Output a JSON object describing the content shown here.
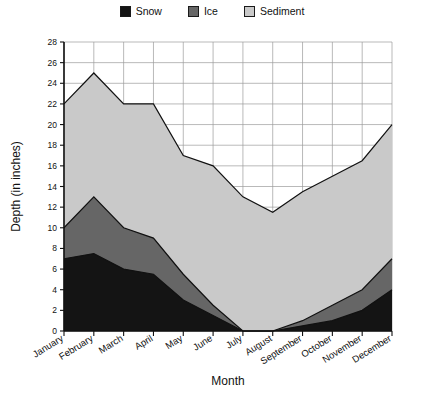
{
  "chart_data": {
    "type": "area",
    "stacked": true,
    "title": "",
    "xlabel": "Month",
    "ylabel": "Depth (in inches)",
    "ylim": [
      0,
      28
    ],
    "ytick_step": 2,
    "yticks": [
      0,
      2,
      4,
      6,
      8,
      10,
      12,
      14,
      16,
      18,
      20,
      22,
      24,
      26,
      28
    ],
    "grid": true,
    "legend_position": "top-center",
    "categories": [
      "January",
      "February",
      "March",
      "April",
      "May",
      "June",
      "July",
      "August",
      "September",
      "October",
      "November",
      "December"
    ],
    "series": [
      {
        "name": "Snow",
        "color": "#141414",
        "values": [
          7,
          7.5,
          6,
          5.5,
          3,
          1.5,
          0,
          0,
          0.5,
          1,
          2,
          4
        ]
      },
      {
        "name": "Ice",
        "color": "#666666",
        "values": [
          3,
          5.5,
          4,
          3.5,
          2.5,
          1,
          0,
          0,
          0.5,
          1.5,
          2,
          3
        ]
      },
      {
        "name": "Sediment",
        "color": "#c9c9c9",
        "values": [
          12,
          12,
          12,
          13,
          11.5,
          13.5,
          13,
          11.5,
          12.5,
          12.5,
          12.5,
          13
        ]
      }
    ],
    "cumulative_totals": [
      22,
      25,
      22,
      22,
      17,
      16,
      13,
      11.5,
      13.5,
      15,
      16.5,
      20
    ]
  },
  "legend": {
    "items": [
      {
        "label": "Snow",
        "color": "#141414",
        "icon": "legend-swatch-snow"
      },
      {
        "label": "Ice",
        "color": "#666666",
        "icon": "legend-swatch-ice"
      },
      {
        "label": "Sediment",
        "color": "#c9c9c9",
        "icon": "legend-swatch-sediment"
      }
    ]
  },
  "axes": {
    "y_title": "Depth (in inches)",
    "x_title": "Month",
    "y_labels": [
      "28",
      "26",
      "24",
      "22",
      "20",
      "18",
      "16",
      "14",
      "12",
      "10",
      "8",
      "6",
      "4",
      "2",
      "0"
    ],
    "x_labels": [
      "January",
      "February",
      "March",
      "April",
      "May",
      "June",
      "July",
      "August",
      "September",
      "October",
      "November",
      "December"
    ]
  }
}
